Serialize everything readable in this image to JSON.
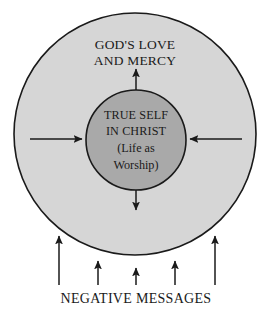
{
  "diagram": {
    "type": "concentric-circles",
    "title_top_line1": "GOD'S LOVE",
    "title_top_line2": "AND MERCY",
    "inner_line1": "TRUE SELF",
    "inner_line2": "IN CHRIST",
    "inner_line3": "(Life as",
    "inner_line4": "Worship)",
    "bottom_label": "NEGATIVE MESSAGES",
    "colors": {
      "outer_circle_fill": "#d6d6d6",
      "inner_circle_fill": "#a9a9a9",
      "stroke": "#1a1a1a",
      "text": "#1a1a1a",
      "background": "#ffffff"
    },
    "geometry": {
      "outer_circle": {
        "cx": 135,
        "cy": 134,
        "r": 121
      },
      "inner_circle": {
        "cx": 136,
        "cy": 140,
        "r": 50
      }
    },
    "radial_arrows": [
      {
        "name": "up",
        "direction": "outward",
        "from_x": 136,
        "from_y": 90,
        "to_x": 136,
        "to_y": 67
      },
      {
        "name": "down",
        "direction": "outward",
        "from_x": 136,
        "from_y": 190,
        "to_x": 136,
        "to_y": 212
      },
      {
        "name": "left",
        "direction": "inward",
        "from_x": 30,
        "from_y": 139,
        "to_x": 84,
        "to_y": 139
      },
      {
        "name": "right",
        "direction": "inward",
        "from_x": 242,
        "from_y": 139,
        "to_x": 188,
        "to_y": 139
      }
    ],
    "bottom_arrows": [
      {
        "x": 59,
        "from_y": 285,
        "to_y": 234
      },
      {
        "x": 98,
        "from_y": 285,
        "to_y": 259
      },
      {
        "x": 136,
        "from_y": 285,
        "to_y": 266
      },
      {
        "x": 175,
        "from_y": 285,
        "to_y": 259
      },
      {
        "x": 215,
        "from_y": 285,
        "to_y": 234
      }
    ]
  }
}
